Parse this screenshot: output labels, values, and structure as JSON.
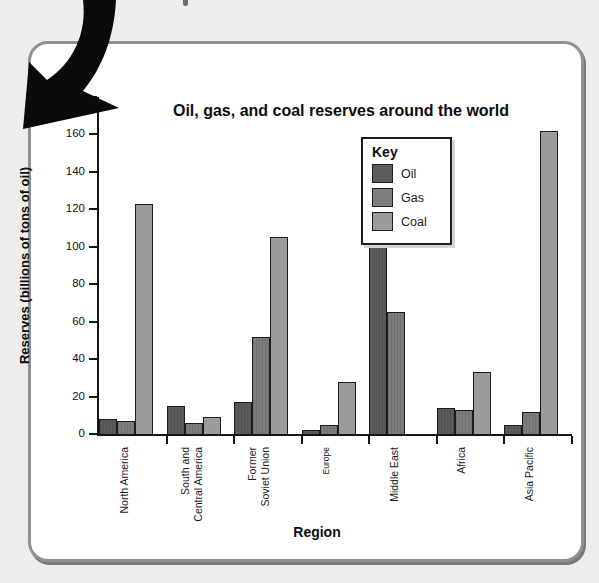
{
  "title": "Oil, gas, and coal reserves around the world",
  "legend": {
    "title": "Key",
    "items": [
      {
        "label": "Oil",
        "color": "#5b5b5b"
      },
      {
        "label": "Gas",
        "color": "#7d7d7d"
      },
      {
        "label": "Coal",
        "color": "#9c9c9c"
      }
    ]
  },
  "chart_data": {
    "type": "bar",
    "title": "Oil, gas, and coal reserves around the world",
    "xlabel": "Region",
    "ylabel": "Reserves (billions of tons of oil)",
    "ylim": [
      0,
      180
    ],
    "yticks": [
      0,
      20,
      40,
      60,
      80,
      100,
      120,
      140,
      160,
      180
    ],
    "grid": false,
    "legend_position": "top-center-inside",
    "categories": [
      {
        "label": "North America"
      },
      {
        "label": "South and\nCentral America"
      },
      {
        "label": "Former\nSoviet Union"
      },
      {
        "label": "Europe",
        "small": true
      },
      {
        "label": "Middle East"
      },
      {
        "label": "Africa"
      },
      {
        "label": "Asia Pacific"
      }
    ],
    "series": [
      {
        "name": "Oil",
        "color": "#5b5b5b",
        "hatch": true,
        "values": [
          8,
          15,
          17,
          2,
          101,
          14,
          5
        ]
      },
      {
        "name": "Gas",
        "color": "#7d7d7d",
        "hatch": true,
        "values": [
          7,
          6,
          52,
          5,
          65,
          13,
          12
        ]
      },
      {
        "name": "Coal",
        "color": "#9c9c9c",
        "hatch": false,
        "values": [
          123,
          9,
          105,
          28,
          0,
          33,
          162
        ]
      }
    ]
  },
  "colors": {
    "page_background": "#edeeec",
    "card_background": "#ffffff",
    "card_border": "#919191",
    "axis": "#151515",
    "arrow": "#0a0a0a"
  }
}
